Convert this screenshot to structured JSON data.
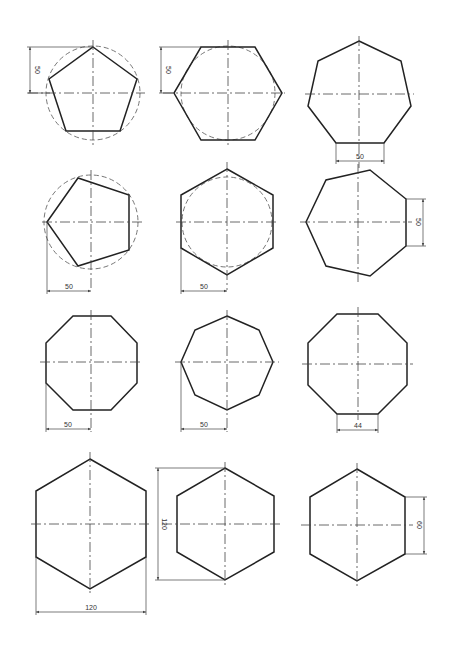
{
  "drawings": [
    {
      "id": "pentagon-circumscribed",
      "shape": "pentagon",
      "sides": 5,
      "dimension": "50",
      "dimension_orientation": "vertical",
      "dimension_ref": "apex to center height",
      "circle": true
    },
    {
      "id": "hexagon-circumscribed",
      "shape": "hexagon",
      "sides": 6,
      "dimension": "50",
      "dimension_orientation": "vertical",
      "dimension_ref": "top edge to center",
      "circle": true
    },
    {
      "id": "heptagon-side",
      "shape": "heptagon",
      "sides": 7,
      "dimension": "50",
      "dimension_orientation": "horizontal",
      "dimension_ref": "bottom side length",
      "circle": false
    },
    {
      "id": "pentagon-rotated",
      "shape": "pentagon",
      "sides": 5,
      "dimension": "50",
      "dimension_orientation": "horizontal",
      "dimension_ref": "left vertex to center",
      "circle": true
    },
    {
      "id": "hexagon-inscribed",
      "shape": "hexagon",
      "sides": 6,
      "dimension": "50",
      "dimension_orientation": "horizontal",
      "dimension_ref": "left side to center",
      "circle": true
    },
    {
      "id": "heptagon-rotated",
      "shape": "heptagon",
      "sides": 7,
      "dimension": "50",
      "dimension_orientation": "vertical",
      "dimension_ref": "right side length",
      "circle": false
    },
    {
      "id": "octagon-flat",
      "shape": "octagon",
      "sides": 8,
      "dimension": "50",
      "dimension_orientation": "horizontal",
      "dimension_ref": "left side to center",
      "circle": false
    },
    {
      "id": "octagon-pointed",
      "shape": "octagon",
      "sides": 8,
      "dimension": "50",
      "dimension_orientation": "horizontal",
      "dimension_ref": "left vertex to center",
      "circle": false
    },
    {
      "id": "octagon-side",
      "shape": "octagon",
      "sides": 8,
      "dimension": "44",
      "dimension_orientation": "horizontal",
      "dimension_ref": "bottom side length",
      "circle": false
    },
    {
      "id": "hexagon-width",
      "shape": "hexagon",
      "sides": 6,
      "dimension": "120",
      "dimension_orientation": "horizontal",
      "dimension_ref": "across flats",
      "circle": false
    },
    {
      "id": "hexagon-height",
      "shape": "hexagon",
      "sides": 6,
      "dimension": "120",
      "dimension_orientation": "vertical",
      "dimension_ref": "across corners",
      "circle": false
    },
    {
      "id": "hexagon-side",
      "shape": "hexagon",
      "sides": 6,
      "dimension": "60",
      "dimension_orientation": "vertical",
      "dimension_ref": "right side length",
      "circle": false
    }
  ]
}
